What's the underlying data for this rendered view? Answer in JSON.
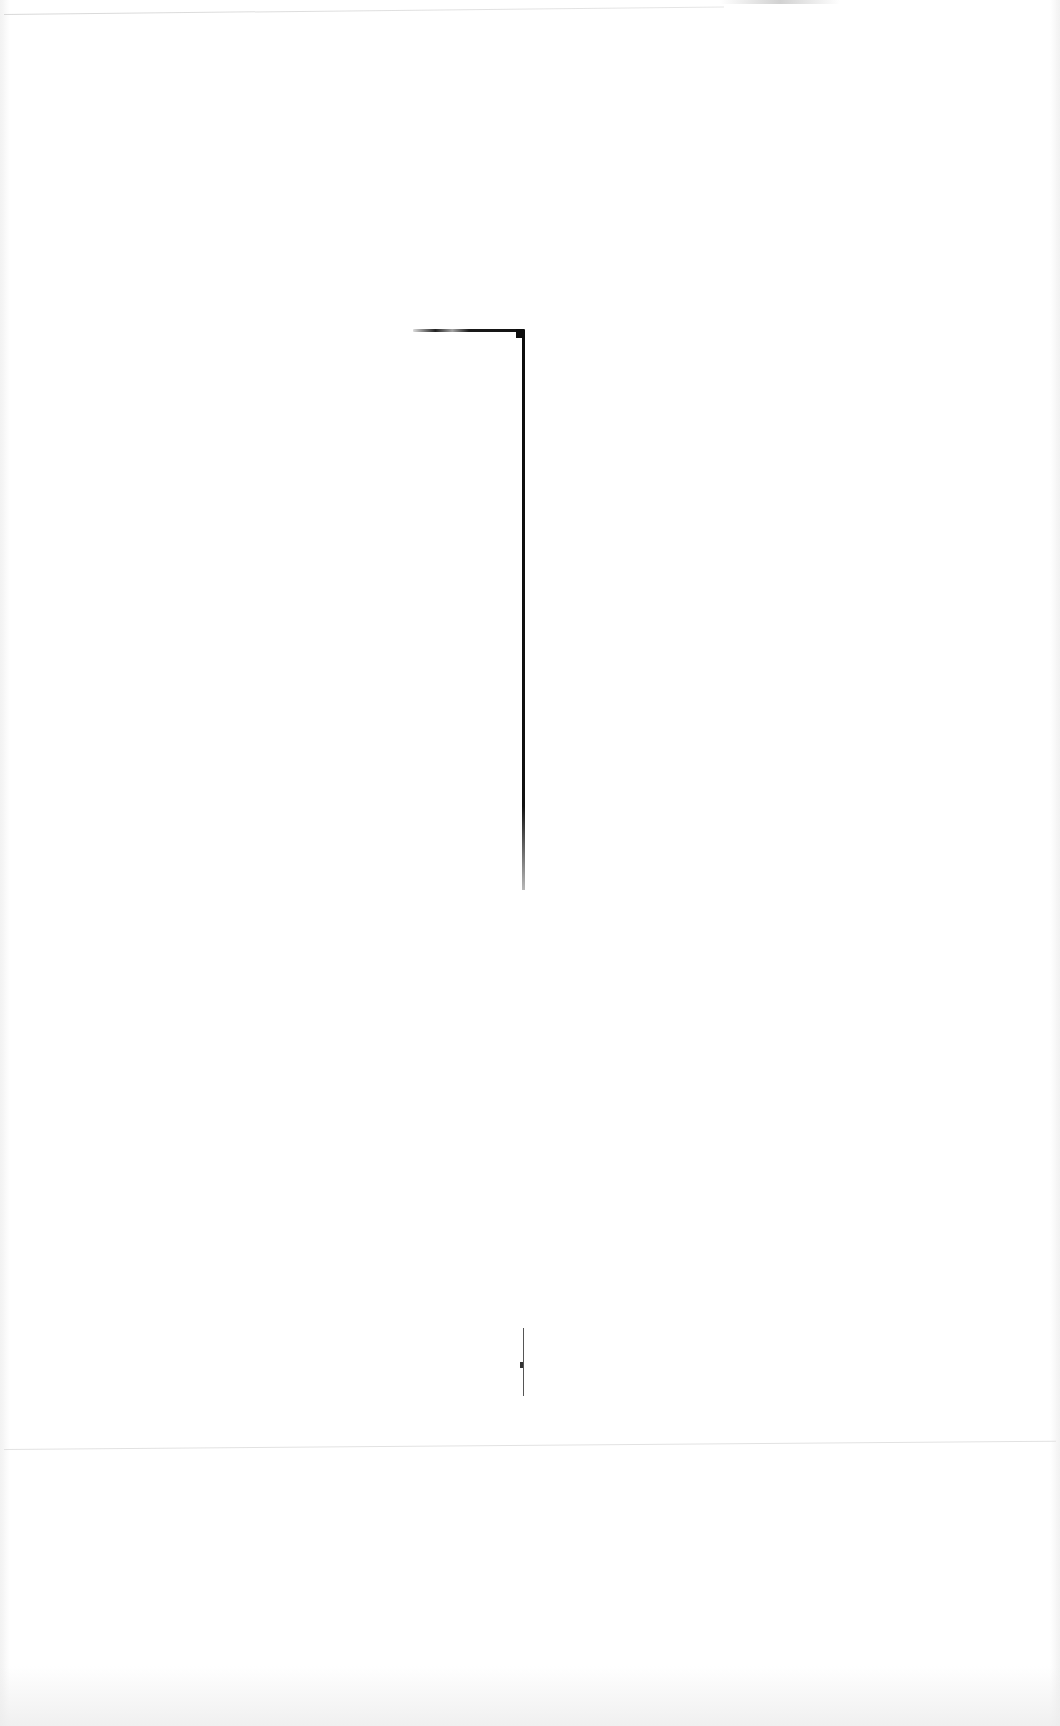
{
  "document": {
    "type": "scanned-page",
    "text_content": "",
    "marks": [
      {
        "name": "corner-line",
        "description": "horizontal stroke turning into long vertical stroke"
      },
      {
        "name": "short-vertical-line",
        "description": "short vertical stroke with small tick"
      }
    ]
  },
  "colors": {
    "background": "#ffffff",
    "ink": "#111111",
    "edge": "#dddddd"
  }
}
